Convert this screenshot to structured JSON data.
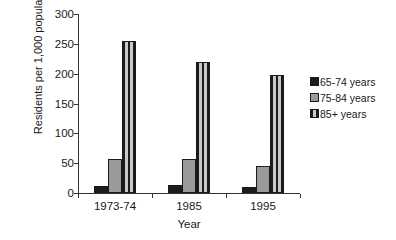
{
  "chart_data": {
    "type": "bar",
    "title": "",
    "subtitle": "",
    "xlabel": "Year",
    "ylabel": "Residents per 1,000 population",
    "categories": [
      "1973-74",
      "1985",
      "1995"
    ],
    "series": [
      {
        "name": "65-74 years",
        "values": [
          12,
          13,
          10
        ],
        "color": "#1c1c1c",
        "fill": "solid-black"
      },
      {
        "name": "75-84 years",
        "values": [
          57,
          57,
          46
        ],
        "color": "#9a9a9a",
        "fill": "solid-gray"
      },
      {
        "name": "85+ years",
        "values": [
          255,
          220,
          198
        ],
        "color": "#c9c9c9",
        "fill": "vertical-stripes"
      }
    ],
    "ylim": [
      0,
      300
    ],
    "yticks": [
      0,
      50,
      100,
      150,
      200,
      250,
      300
    ],
    "ytick_labels": [
      "0",
      "50",
      "100",
      "150",
      "200",
      "250",
      "300"
    ],
    "grid": false,
    "legend_position": "right",
    "legend_entries": [
      "65-74 years",
      "75-84 years",
      "85+ years"
    ]
  }
}
